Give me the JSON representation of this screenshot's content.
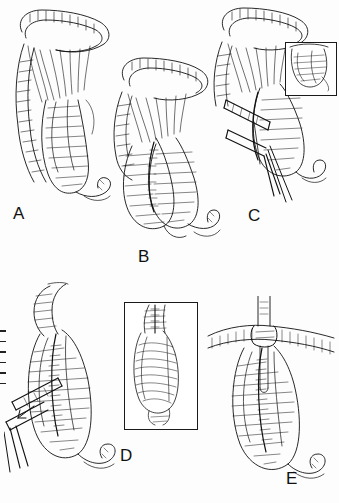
{
  "figure": {
    "medium": "pen-and-ink hatched line art, black on white",
    "panels": [
      {
        "id": "A",
        "label": "A",
        "label_pos": {
          "x": 13,
          "y": 213
        },
        "caption_text": "A",
        "content": "Mobilized bowel segment with mesentery fan and distal limb, viewed anteriorly"
      },
      {
        "id": "B",
        "label": "B",
        "label_pos": {
          "x": 138,
          "y": 256
        },
        "caption_text": "B",
        "content": "Two bowel limbs apposed side-to-side with mesenteric vessels, distal loop hanging inferiorly"
      },
      {
        "id": "C",
        "label": "C",
        "label_pos": {
          "x": 248,
          "y": 215
        },
        "caption_text": "C",
        "content": "Linear stapler inserted between apposed limbs; inset shows close-up of enterotomy",
        "inset": {
          "x": 285,
          "y": 42,
          "w": 50,
          "h": 52,
          "content": "magnified enterotomy opening"
        }
      },
      {
        "id": "D",
        "label": "D",
        "label_pos": {
          "x": 120,
          "y": 455
        },
        "caption_text": "D",
        "content": "Stapler firing along the common wall creating the anastomosis; inset shows completed staple line lumen",
        "inset": {
          "x": 124,
          "y": 302,
          "w": 72,
          "h": 126,
          "content": "magnified interior staple line and mucosal folds"
        }
      },
      {
        "id": "E",
        "label": "E",
        "label_pos": {
          "x": 286,
          "y": 478
        },
        "caption_text": "E",
        "content": "Closure of the enterotomy with suture over a drain/tube, completed anastomosis"
      }
    ],
    "margin_marks": {
      "count": 6,
      "note": "small tick marks at left page edge"
    }
  }
}
